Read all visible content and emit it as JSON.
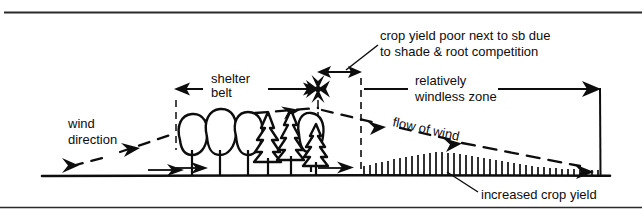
{
  "diagram": {
    "colors": {
      "ink": "#0d0d0d",
      "background": "#ffffff",
      "rule": "#2a2a2a"
    },
    "labels": {
      "wind_direction": "wind\ndirection",
      "wind_direction_line1": "wind",
      "wind_direction_line2": "direction",
      "shelter_belt_line1": "shelter",
      "shelter_belt_line2": "belt",
      "shade_note_line1": "crop yield poor next to sb due",
      "shade_note_line2": "to shade & root competition",
      "windless_line1": "relatively",
      "windless_line2": "windless zone",
      "flow_of_wind": "flow of wind",
      "increased_crop_yield": "increased crop yield"
    },
    "zones": [
      {
        "name": "shelter-belt",
        "label": "shelter belt",
        "x_start": 175,
        "x_end": 318
      },
      {
        "name": "shade-zone",
        "label": "crop yield poor next to sb due to shade & root competition",
        "x_start": 318,
        "x_end": 362
      },
      {
        "name": "windless-zone",
        "label": "relatively windless zone",
        "x_start": 362,
        "x_end": 600
      }
    ],
    "ground": {
      "y": 175,
      "x_start": 42,
      "x_end": 610
    },
    "crop": {
      "x_start": 362,
      "x_end": 600,
      "description": "vertical stalk hatching, tallest mid-field, shorter at far right"
    },
    "trees": [
      {
        "type": "deciduous",
        "x": 192
      },
      {
        "type": "deciduous",
        "x": 215
      },
      {
        "type": "deciduous",
        "x": 238
      },
      {
        "type": "conifer",
        "x": 262
      },
      {
        "type": "conifer",
        "x": 286
      },
      {
        "type": "deciduous",
        "x": 300
      },
      {
        "type": "conifer",
        "x": 312
      }
    ],
    "frame": {
      "top_rule_y": 12,
      "bottom_rule_y": 207
    }
  }
}
